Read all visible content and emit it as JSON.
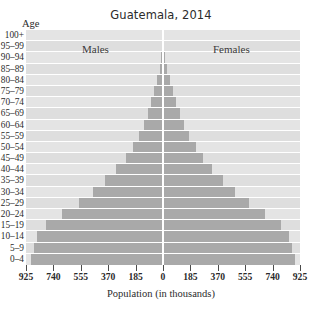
{
  "chart_data": {
    "type": "bar",
    "subtype": "population-pyramid",
    "title": "Guatemala, 2014",
    "xlabel": "Population (in thousands)",
    "ylabel": "Age",
    "grid": true,
    "legend_position": "inside-top",
    "orientation": "horizontal",
    "xlim": [
      -925,
      925
    ],
    "xticks": [
      -925,
      -740,
      -555,
      -370,
      -185,
      0,
      185,
      370,
      555,
      740,
      925
    ],
    "xticklabels": [
      "925",
      "740",
      "555",
      "370",
      "185",
      "0",
      "185",
      "370",
      "555",
      "740",
      "925"
    ],
    "categories": [
      "100+",
      "95–99",
      "90–94",
      "85–89",
      "80–84",
      "75–79",
      "70–74",
      "65–69",
      "60–64",
      "55–59",
      "50–54",
      "45–49",
      "40–44",
      "35–39",
      "30–34",
      "25–29",
      "20–24",
      "15–19",
      "10–14",
      "5–9",
      "0–4"
    ],
    "series": [
      {
        "name": "Males",
        "side": "left",
        "values": [
          2,
          5,
          11,
          22,
          40,
          58,
          78,
          101,
          128,
          163,
          205,
          253,
          315,
          390,
          470,
          565,
          680,
          790,
          850,
          870,
          890
        ]
      },
      {
        "name": "Females",
        "side": "right",
        "values": [
          3,
          7,
          14,
          27,
          47,
          66,
          87,
          112,
          140,
          176,
          220,
          270,
          332,
          405,
          485,
          578,
          690,
          795,
          852,
          872,
          890
        ]
      }
    ],
    "units": "thousands"
  },
  "figure": {
    "title": "Guatemala, 2014",
    "age_axis_label": "Age",
    "xaxis_title": "Population (in thousands)",
    "males_caption": "Males",
    "females_caption": "Females"
  }
}
